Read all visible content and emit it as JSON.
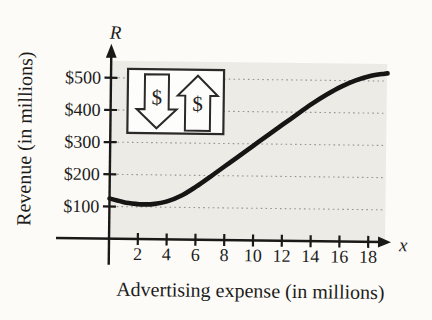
{
  "figure": {
    "y_axis_symbol": "R",
    "x_axis_symbol": "x",
    "y_axis_title": "Revenue (in millions)",
    "x_axis_title": "Advertising expense (in millions)"
  },
  "icon_legend": {
    "dollar_down_symbol": "$",
    "dollar_up_symbol": "$"
  },
  "colors": {
    "curve": "#161514",
    "axis": "#1a1918",
    "plot_background": "#ecebe6",
    "gridline": "#97948e",
    "paper": "#fcfbf8",
    "icon_box_fill": "#fdfdfb",
    "icon_box_border": "#2b2a28"
  },
  "chart_data": {
    "type": "line",
    "title": "",
    "xlabel": "Advertising expense (in millions)",
    "ylabel": "Revenue (in millions)",
    "x_axis_symbol": "x",
    "y_axis_symbol": "R",
    "xlim": [
      0,
      19.5
    ],
    "ylim": [
      0,
      560
    ],
    "x_ticks": [
      2,
      4,
      6,
      8,
      10,
      12,
      14,
      16,
      18
    ],
    "y_ticks": [
      100,
      200,
      300,
      400,
      500
    ],
    "y_tick_labels": [
      "$100",
      "$200",
      "$300",
      "$400",
      "$500"
    ],
    "grid": "dotted horizontal gridlines at each y tick over shaded plot region",
    "legend_position": "none",
    "annotations": [
      "inset box with dollar-down arrow and dollar-up arrow icons"
    ],
    "series": [
      {
        "name": "Revenue curve",
        "x": [
          0,
          1,
          2,
          2.5,
          3,
          4,
          5,
          6,
          7,
          8,
          9,
          10,
          11,
          12,
          13,
          14,
          15,
          16,
          17,
          18,
          19,
          19.2
        ],
        "y": [
          125,
          114,
          108.5,
          108,
          109,
          118,
          137,
          165,
          197,
          230,
          263,
          296,
          329,
          362,
          395,
          427,
          456,
          481,
          501,
          515,
          523,
          524
        ]
      }
    ]
  }
}
